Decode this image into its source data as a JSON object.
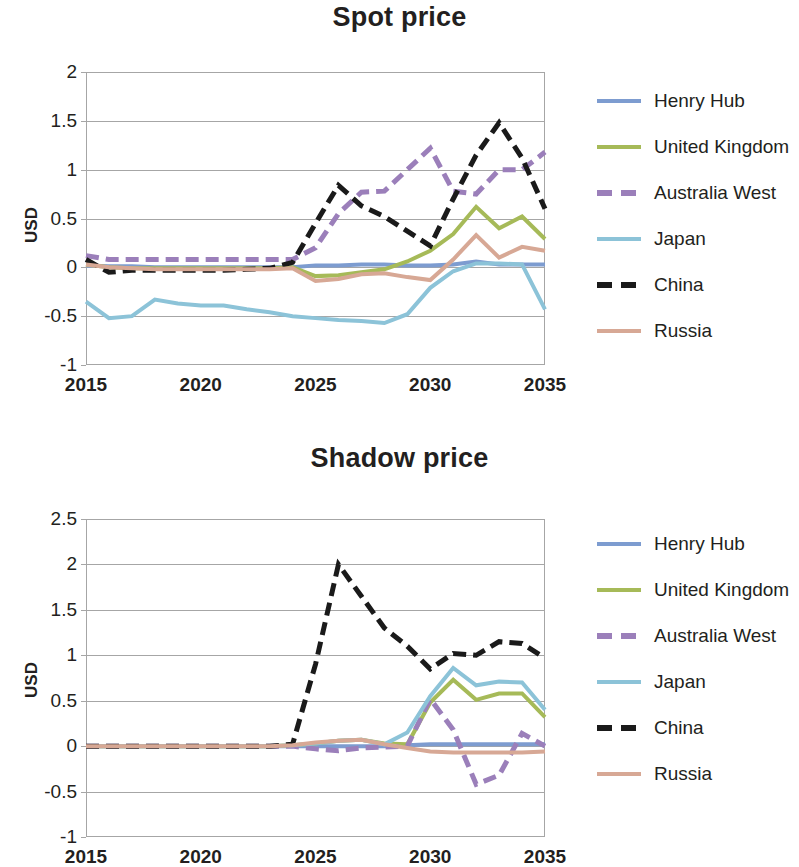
{
  "page": {
    "axis_label": "USD"
  },
  "panels": [
    {
      "key": "spot",
      "title": "Spot price"
    },
    {
      "key": "shadow",
      "title": "Shadow price"
    }
  ],
  "legend": {
    "items": [
      {
        "label": "Henry Hub",
        "color": "#7d9cd0",
        "dash": false
      },
      {
        "label": "United Kingdom",
        "color": "#a6ba58",
        "dash": false
      },
      {
        "label": "Australia West",
        "color": "#9b7fba",
        "dash": true
      },
      {
        "label": "Japan",
        "color": "#8cc3d8",
        "dash": false
      },
      {
        "label": "China",
        "color": "#1a1a1a",
        "dash": true
      },
      {
        "label": "Russia",
        "color": "#d7a895",
        "dash": false
      }
    ]
  },
  "chart_data": [
    {
      "type": "line",
      "title": "Spot price",
      "xlabel": "",
      "ylabel": "USD",
      "xlim": [
        2015,
        2035
      ],
      "ylim": [
        -1,
        2
      ],
      "yticks": [
        2,
        1.5,
        1,
        0.5,
        0,
        -0.5,
        -1
      ],
      "xticks": [
        2015,
        2020,
        2025,
        2030,
        2035
      ],
      "grid": true,
      "legend_position": "right",
      "x": [
        2015,
        2016,
        2017,
        2018,
        2019,
        2020,
        2021,
        2022,
        2023,
        2024,
        2025,
        2026,
        2027,
        2028,
        2029,
        2030,
        2031,
        2032,
        2033,
        2034,
        2035
      ],
      "series": [
        {
          "name": "Henry Hub",
          "color": "#7d9cd0",
          "dash": false,
          "values": [
            0.02,
            0.01,
            0.01,
            0.0,
            0.0,
            0.0,
            0.0,
            0.0,
            0.0,
            0.0,
            0.02,
            0.02,
            0.03,
            0.03,
            0.02,
            0.02,
            0.03,
            0.06,
            0.03,
            0.03,
            0.03
          ]
        },
        {
          "name": "United Kingdom",
          "color": "#a6ba58",
          "dash": false,
          "values": [
            0.03,
            0.0,
            -0.01,
            -0.01,
            -0.01,
            -0.01,
            -0.01,
            -0.01,
            -0.01,
            0.0,
            -0.09,
            -0.08,
            -0.05,
            -0.02,
            0.06,
            0.17,
            0.34,
            0.62,
            0.4,
            0.52,
            0.29
          ]
        },
        {
          "name": "Australia West",
          "color": "#9b7fba",
          "dash": true,
          "values": [
            0.12,
            0.08,
            0.08,
            0.08,
            0.08,
            0.08,
            0.08,
            0.08,
            0.08,
            0.08,
            0.2,
            0.55,
            0.77,
            0.78,
            1.0,
            1.22,
            0.78,
            0.75,
            1.0,
            1.0,
            1.18
          ]
        },
        {
          "name": "Japan",
          "color": "#8cc3d8",
          "dash": false,
          "values": [
            -0.35,
            -0.52,
            -0.5,
            -0.33,
            -0.37,
            -0.39,
            -0.39,
            -0.43,
            -0.46,
            -0.5,
            -0.52,
            -0.54,
            -0.55,
            -0.57,
            -0.48,
            -0.21,
            -0.04,
            0.04,
            0.04,
            0.03,
            -0.43
          ]
        },
        {
          "name": "China",
          "color": "#1a1a1a",
          "dash": true,
          "values": [
            0.08,
            -0.05,
            -0.03,
            -0.03,
            -0.03,
            -0.03,
            -0.03,
            -0.02,
            -0.01,
            0.05,
            0.45,
            0.84,
            0.63,
            0.52,
            0.37,
            0.22,
            0.7,
            1.15,
            1.48,
            1.12,
            0.6
          ]
        },
        {
          "name": "Russia",
          "color": "#d7a895",
          "dash": false,
          "values": [
            0.03,
            0.0,
            -0.01,
            -0.02,
            -0.02,
            -0.02,
            -0.02,
            -0.02,
            -0.02,
            -0.01,
            -0.14,
            -0.12,
            -0.07,
            -0.06,
            -0.1,
            -0.13,
            0.08,
            0.33,
            0.1,
            0.21,
            0.17
          ]
        }
      ]
    },
    {
      "type": "line",
      "title": "Shadow price",
      "xlabel": "",
      "ylabel": "USD",
      "xlim": [
        2015,
        2035
      ],
      "ylim": [
        -1,
        2.5
      ],
      "yticks": [
        2.5,
        2,
        1.5,
        1,
        0.5,
        0,
        -0.5,
        -1
      ],
      "xticks": [
        2015,
        2020,
        2025,
        2030,
        2035
      ],
      "grid": true,
      "legend_position": "right",
      "x": [
        2015,
        2016,
        2017,
        2018,
        2019,
        2020,
        2021,
        2022,
        2023,
        2024,
        2025,
        2026,
        2027,
        2028,
        2029,
        2030,
        2031,
        2032,
        2033,
        2034,
        2035
      ],
      "series": [
        {
          "name": "Henry Hub",
          "color": "#7d9cd0",
          "dash": false,
          "values": [
            0.0,
            0.0,
            0.0,
            0.0,
            0.0,
            0.0,
            0.0,
            0.0,
            0.0,
            0.0,
            0.0,
            0.0,
            0.0,
            0.0,
            0.01,
            0.02,
            0.02,
            0.02,
            0.02,
            0.02,
            0.02
          ]
        },
        {
          "name": "United Kingdom",
          "color": "#a6ba58",
          "dash": false,
          "values": [
            0.0,
            0.0,
            0.0,
            0.0,
            0.0,
            0.0,
            0.0,
            0.0,
            0.0,
            0.01,
            0.03,
            0.06,
            0.07,
            0.03,
            0.02,
            0.48,
            0.73,
            0.51,
            0.58,
            0.58,
            0.32
          ]
        },
        {
          "name": "Australia West",
          "color": "#9b7fba",
          "dash": true,
          "values": [
            0.0,
            0.0,
            0.0,
            0.0,
            0.0,
            0.0,
            0.0,
            0.0,
            0.0,
            0.0,
            -0.03,
            -0.05,
            -0.02,
            -0.01,
            0.0,
            0.52,
            0.18,
            -0.42,
            -0.32,
            0.14,
            0.0
          ]
        },
        {
          "name": "Japan",
          "color": "#8cc3d8",
          "dash": false,
          "values": [
            0.0,
            0.0,
            0.0,
            0.0,
            0.0,
            0.0,
            0.0,
            0.0,
            0.0,
            0.01,
            0.03,
            0.06,
            0.07,
            0.02,
            0.15,
            0.55,
            0.86,
            0.67,
            0.71,
            0.7,
            0.4
          ]
        },
        {
          "name": "China",
          "color": "#1a1a1a",
          "dash": true,
          "values": [
            0.0,
            0.0,
            0.0,
            0.0,
            0.0,
            0.0,
            0.0,
            0.0,
            0.0,
            0.02,
            0.9,
            2.0,
            1.65,
            1.3,
            1.1,
            0.85,
            1.02,
            1.0,
            1.15,
            1.13,
            0.97
          ]
        },
        {
          "name": "Russia",
          "color": "#d7a895",
          "dash": false,
          "values": [
            0.0,
            0.0,
            0.0,
            0.0,
            0.0,
            0.0,
            0.0,
            0.0,
            0.0,
            0.01,
            0.04,
            0.06,
            0.07,
            0.02,
            -0.02,
            -0.06,
            -0.07,
            -0.07,
            -0.07,
            -0.07,
            -0.06
          ]
        }
      ]
    }
  ]
}
